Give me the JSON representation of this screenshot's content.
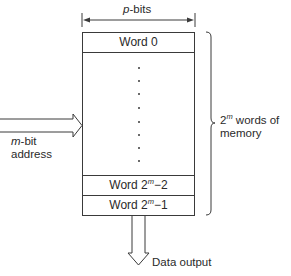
{
  "width_label": {
    "var": "p",
    "text": "-bits"
  },
  "words": {
    "first": "Word 0",
    "second_last_prefix": "Word 2",
    "second_last_exp": "m",
    "second_last_suffix": "−2",
    "last_prefix": "Word 2",
    "last_exp": "m",
    "last_suffix": "−1"
  },
  "ellipsis_dot_count": 8,
  "address_label": {
    "var": "m",
    "line1_suffix": "-bit",
    "line2": "address"
  },
  "memory_label": {
    "base": "2",
    "exp": "m",
    "line1_suffix": " words of",
    "line2": "memory"
  },
  "output_label": "Data output",
  "colors": {
    "line": "#3a3a3a",
    "text": "#2a2a2a",
    "background": "#ffffff"
  }
}
